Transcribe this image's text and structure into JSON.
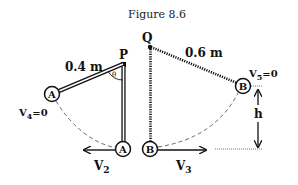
{
  "figure": {
    "title": "Figure 8.6",
    "pivots": {
      "p": {
        "label": "P"
      },
      "q": {
        "label": "Q"
      }
    },
    "lengths": {
      "rod_a": "0.4 m",
      "string_b": "0.6 m"
    },
    "angle_label": "θ",
    "masses": {
      "a_left": "A",
      "a_bottom": "A",
      "b_bottom": "B",
      "b_right": "B"
    },
    "velocities": {
      "v4": {
        "main": "V",
        "sub": "4",
        "rest": "=0"
      },
      "v5": {
        "main": "V",
        "sub": "5",
        "rest": "=0"
      },
      "v2": {
        "main": "V",
        "sub": "2"
      },
      "v3": {
        "main": "V",
        "sub": "3"
      }
    },
    "height_label": "h"
  }
}
